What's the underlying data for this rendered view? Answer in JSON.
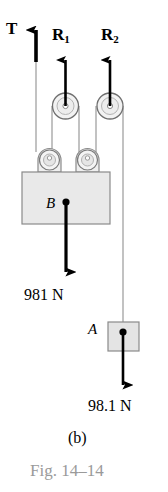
{
  "figure": {
    "caption": "Fig. 14–14",
    "panel": "(b)",
    "caption_color": "#9a9a9a",
    "ink_color": "#000000",
    "body_fill": "#e8e8e8",
    "body_stroke": "#8a8a8a",
    "rope_color": "#a8a8a8"
  },
  "forces": {
    "tension": {
      "label": "T",
      "direction": "up"
    },
    "reaction_1": {
      "label": "R",
      "subscript": "1",
      "direction": "up"
    },
    "reaction_2": {
      "label": "R",
      "subscript": "2",
      "direction": "up"
    }
  },
  "bodies": {
    "block_b": {
      "label": "B",
      "weight": "981 N",
      "weight_direction": "down"
    },
    "block_a": {
      "label": "A",
      "weight": "98.1 N",
      "weight_direction": "down"
    }
  },
  "icons": {
    "pulley_upper_left": "pulley-icon",
    "pulley_upper_right": "pulley-icon",
    "pulley_lower_left": "pulley-icon",
    "pulley_lower_right": "pulley-icon",
    "arrow_tension": "arrow-up-icon",
    "arrow_reaction_1": "arrow-up-icon",
    "arrow_reaction_2": "arrow-up-icon",
    "arrow_weight_b": "arrow-down-icon",
    "arrow_weight_a": "arrow-down-icon"
  }
}
